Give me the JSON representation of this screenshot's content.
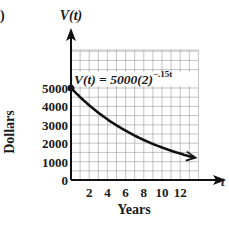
{
  "panel_marker": ")",
  "chart_data": {
    "type": "line",
    "title": "",
    "equation_label": "V(t) = 5000(2)^(-.15t)",
    "equation_parts": {
      "lhs": "V(t) = 5000(2)",
      "exponent": "−.15t"
    },
    "xlabel": "Years",
    "ylabel": "Dollars",
    "x_axis_var": "t",
    "y_axis_var": "V(t)",
    "xlim": [
      0,
      14
    ],
    "ylim": [
      0,
      7000
    ],
    "x_ticks": [
      2,
      4,
      6,
      8,
      10,
      12
    ],
    "x_tick_labels": [
      "2",
      "4",
      "6",
      "8",
      "10",
      "12"
    ],
    "y_ticks": [
      0,
      1000,
      2000,
      3000,
      4000,
      5000
    ],
    "y_tick_labels": [
      "0",
      "1000",
      "2000",
      "3000",
      "4000",
      "5000"
    ],
    "grid": true,
    "series": [
      {
        "name": "V(t)",
        "x": [
          0,
          1,
          2,
          3,
          4,
          5,
          6,
          7,
          8,
          9,
          10,
          11,
          12,
          13,
          14
        ],
        "values": [
          5000,
          4506,
          4061,
          3660,
          3299,
          2973,
          2679,
          2415,
          2176,
          1961,
          1768,
          1593,
          1436,
          1294,
          1166
        ]
      }
    ],
    "start_point": {
      "x": 0,
      "y": 5000
    },
    "line_color": "#111111",
    "grid_color": "#9a9a9a"
  }
}
